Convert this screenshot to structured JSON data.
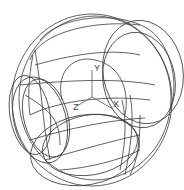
{
  "viewport": {
    "background": "#ffffff",
    "stroke_color": "#3a3a3a",
    "description": "3D wireframe model of a sphere-like solid with circular cutouts"
  },
  "axes": {
    "x_label": "X",
    "y_label": "Y",
    "z_label": "Z"
  }
}
